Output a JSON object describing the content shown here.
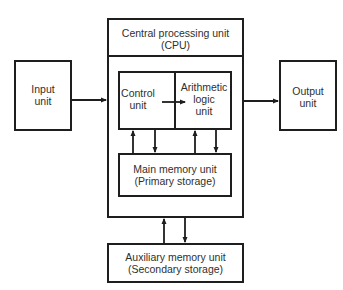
{
  "diagram": {
    "type": "block-diagram",
    "nodes": {
      "input": {
        "line1": "Input",
        "line2": "unit"
      },
      "output": {
        "line1": "Output",
        "line2": "unit"
      },
      "cpu": {
        "line1": "Central processing unit",
        "line2": "(CPU)"
      },
      "control": {
        "line1": "Control",
        "line2": "unit"
      },
      "alu": {
        "line1": "Arithmetic",
        "line2": "logic",
        "line3": "unit"
      },
      "main_memory": {
        "line1": "Main memory unit",
        "line2": "(Primary storage)"
      },
      "auxiliary_memory": {
        "line1": "Auxiliary memory unit",
        "line2": "(Secondary storage)"
      }
    },
    "edges": [
      {
        "from": "Input unit",
        "to": "CPU"
      },
      {
        "from": "CPU",
        "to": "Output unit"
      },
      {
        "from": "Control unit",
        "to": "Arithmetic logic unit"
      },
      {
        "from": "Main memory unit",
        "to": "Control unit"
      },
      {
        "from": "Control unit",
        "to": "Main memory unit"
      },
      {
        "from": "Main memory unit",
        "to": "Arithmetic logic unit"
      },
      {
        "from": "Arithmetic logic unit",
        "to": "Main memory unit"
      },
      {
        "from": "Auxiliary memory unit",
        "to": "CPU"
      },
      {
        "from": "CPU",
        "to": "Auxiliary memory unit"
      }
    ],
    "colors": {
      "stroke": "#1e1e1e",
      "background": "#ffffff",
      "text": "#2f2f2f"
    }
  }
}
